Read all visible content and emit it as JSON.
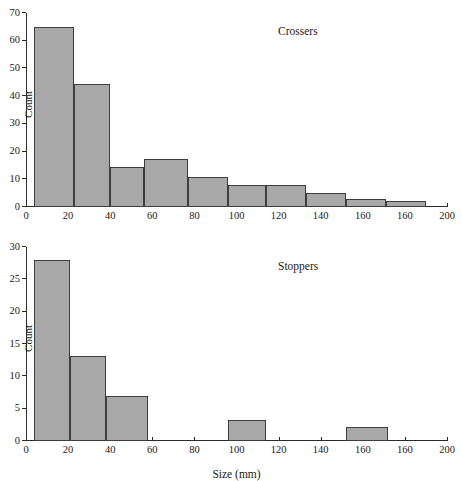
{
  "chart_data": [
    {
      "type": "bar",
      "id": "crossers",
      "title": "Crossers",
      "xlabel": "",
      "ylabel": "Count",
      "xlim": [
        0,
        200
      ],
      "ylim": [
        0,
        70
      ],
      "ytick_values": [
        0,
        10,
        20,
        30,
        40,
        50,
        60,
        70
      ],
      "ytick_labels": [
        "0",
        "10",
        "20",
        "30",
        "40",
        "50",
        "60",
        "70"
      ],
      "xtick_values": [
        0,
        20,
        40,
        60,
        80,
        100,
        120,
        140,
        160,
        180,
        200
      ],
      "xtick_labels": [
        "0",
        "20",
        "40",
        "60",
        "80",
        "100",
        "120",
        "140",
        "160",
        "160",
        "200"
      ],
      "grid": false,
      "legend": "none",
      "bin_edges": [
        4,
        23,
        40,
        56,
        77,
        96,
        114,
        133,
        152,
        171,
        181
      ],
      "values": [
        65,
        44.5,
        14.5,
        17.5,
        11,
        8,
        8,
        5,
        2.8,
        2.2
      ],
      "bars": [
        {
          "x0": 4,
          "x1": 23,
          "value": 65
        },
        {
          "x0": 23,
          "x1": 40,
          "value": 44.5
        },
        {
          "x0": 40,
          "x1": 56,
          "value": 14.5
        },
        {
          "x0": 56,
          "x1": 77,
          "value": 17.5
        },
        {
          "x0": 77,
          "x1": 96,
          "value": 11
        },
        {
          "x0": 96,
          "x1": 114,
          "value": 8
        },
        {
          "x0": 114,
          "x1": 133,
          "value": 8
        },
        {
          "x0": 133,
          "x1": 152,
          "value": 5
        },
        {
          "x0": 152,
          "x1": 171,
          "value": 2.8
        },
        {
          "x0": 171,
          "x1": 190,
          "value": 2.2
        }
      ]
    },
    {
      "type": "bar",
      "id": "stoppers",
      "title": "Stoppers",
      "xlabel": "Size (mm)",
      "ylabel": "Count",
      "xlim": [
        0,
        200
      ],
      "ylim": [
        0,
        30
      ],
      "ytick_values": [
        0,
        5,
        10,
        15,
        20,
        25,
        30
      ],
      "ytick_labels": [
        "0",
        "5",
        "10",
        "15",
        "20",
        "25",
        "30"
      ],
      "xtick_values": [
        0,
        20,
        40,
        60,
        80,
        100,
        120,
        140,
        160,
        180,
        200
      ],
      "xtick_labels": [
        "0",
        "20",
        "40",
        "60",
        "80",
        "100",
        "120",
        "140",
        "160",
        "160",
        "200"
      ],
      "grid": false,
      "legend": "none",
      "bars": [
        {
          "x0": 4,
          "x1": 21,
          "value": 28
        },
        {
          "x0": 21,
          "x1": 38,
          "value": 13.2
        },
        {
          "x0": 38,
          "x1": 58,
          "value": 7
        },
        {
          "x0": 96,
          "x1": 114,
          "value": 3.2
        },
        {
          "x0": 152,
          "x1": 172,
          "value": 2.2
        }
      ]
    }
  ],
  "style": {
    "bar_fill": "#a8a8a8",
    "bar_stroke": "#3d3d3d",
    "axis_color": "#2a2a2a",
    "background": "#ffffff",
    "text_color": "#1a1a1a"
  }
}
